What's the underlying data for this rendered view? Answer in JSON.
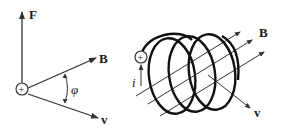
{
  "left_diagram": {
    "labels": {
      "force": "F",
      "field": "B",
      "velocity": "v",
      "angle": "φ",
      "charge": "+"
    }
  },
  "right_diagram": {
    "labels": {
      "field": "B",
      "velocity": "v",
      "current": "i",
      "charge": "+"
    }
  },
  "colors": {
    "stroke": "#333333",
    "coil": "#111111",
    "background": "#ffffff"
  }
}
